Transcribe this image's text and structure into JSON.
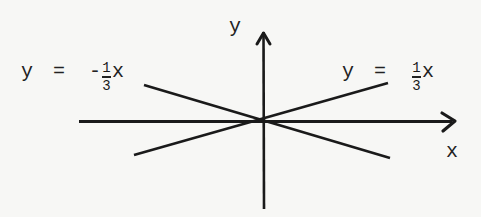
{
  "diagram": {
    "axes": {
      "x_label": "x",
      "y_label": "y"
    },
    "lines": [
      {
        "name": "positive-slope",
        "label": {
          "lhs": "y",
          "eq": "=",
          "sign": "",
          "num": "1",
          "den": "3",
          "var": "x"
        },
        "slope": 0.3333
      },
      {
        "name": "negative-slope",
        "label": {
          "lhs": "y",
          "eq": "=",
          "sign": "-",
          "num": "1",
          "den": "3",
          "var": "x"
        },
        "slope": -0.3333
      }
    ],
    "colors": {
      "ink": "#1a1a1a",
      "background": "#f7f7f5"
    }
  }
}
